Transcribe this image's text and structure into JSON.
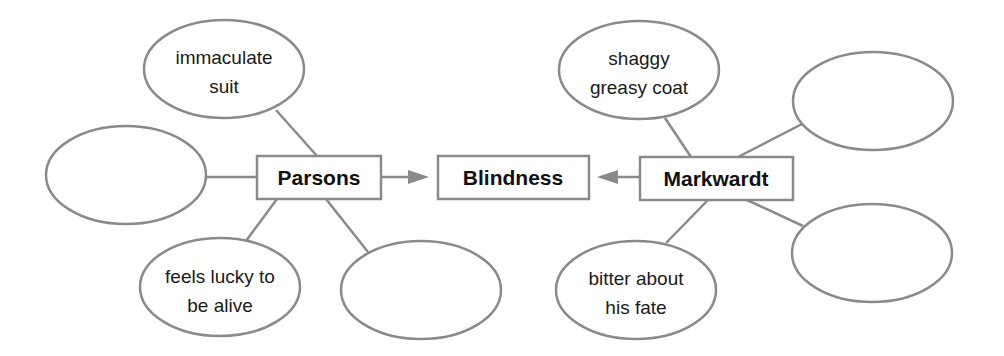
{
  "diagram": {
    "type": "character comparison web",
    "center": {
      "label": "Blindness"
    },
    "left_node": {
      "label": "Parsons",
      "details": [
        {
          "lines": [
            "immaculate",
            "suit"
          ]
        },
        {
          "lines": []
        },
        {
          "lines": [
            "feels lucky to",
            "be alive"
          ]
        },
        {
          "lines": []
        }
      ]
    },
    "right_node": {
      "label": "Markwardt",
      "details": [
        {
          "lines": [
            "shaggy",
            "greasy coat"
          ]
        },
        {
          "lines": []
        },
        {
          "lines": []
        },
        {
          "lines": [
            "bitter about",
            "his fate"
          ]
        }
      ]
    },
    "colors": {
      "stroke": "#8a8a8a",
      "text": "#1a1a1a",
      "background": "#ffffff"
    }
  }
}
